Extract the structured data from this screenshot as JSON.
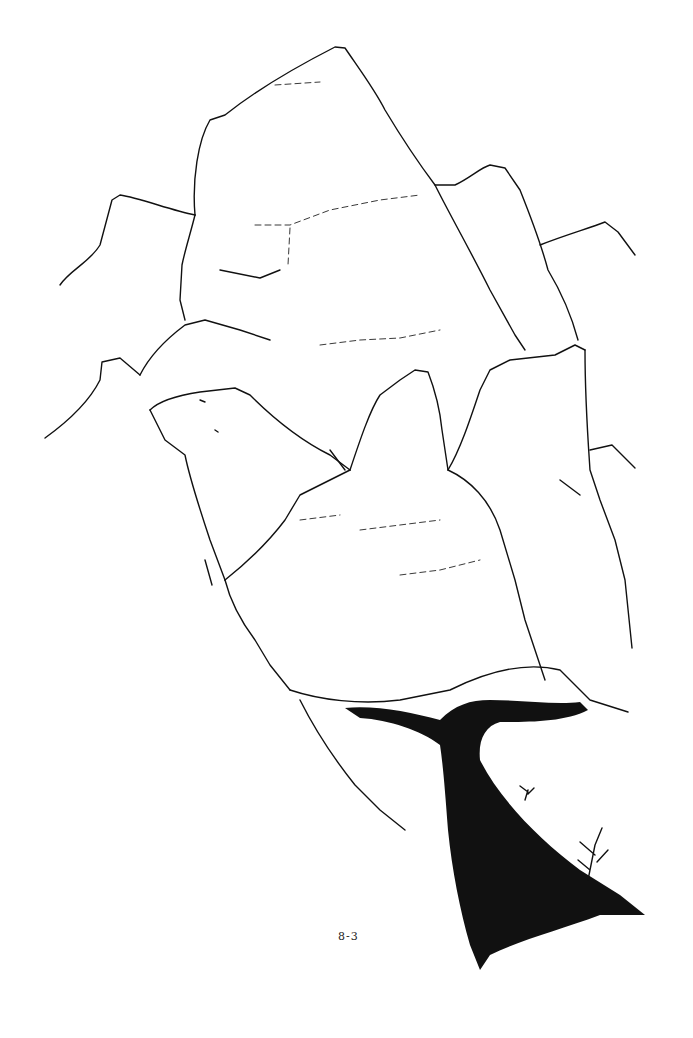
{
  "illustration": {
    "subject": "pen-and-ink drawing of a rocky outcrop with a dark crevice / cave opening at its base",
    "ink_color": "#111111",
    "background_color": "#ffffff"
  },
  "page_label": "8-3"
}
